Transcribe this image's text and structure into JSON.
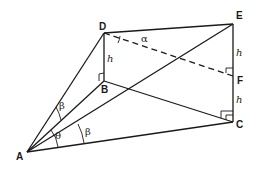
{
  "diagram": {
    "type": "geometry",
    "points": {
      "A": {
        "label": "A",
        "x": 27,
        "y": 152
      },
      "B": {
        "label": "B",
        "x": 104,
        "y": 81
      },
      "C": {
        "label": "C",
        "x": 233,
        "y": 122
      },
      "D": {
        "label": "D",
        "x": 104,
        "y": 33
      },
      "E": {
        "label": "E",
        "x": 233,
        "y": 24
      },
      "F": {
        "label": "F",
        "x": 233,
        "y": 76
      }
    },
    "segments": [
      {
        "from": "A",
        "to": "D",
        "style": "solid"
      },
      {
        "from": "A",
        "to": "B",
        "style": "solid"
      },
      {
        "from": "A",
        "to": "E",
        "style": "solid"
      },
      {
        "from": "A",
        "to": "C",
        "style": "solid"
      },
      {
        "from": "D",
        "to": "B",
        "style": "solid"
      },
      {
        "from": "D",
        "to": "E",
        "style": "solid"
      },
      {
        "from": "B",
        "to": "C",
        "style": "solid"
      },
      {
        "from": "E",
        "to": "C",
        "style": "solid"
      },
      {
        "from": "D",
        "to": "F",
        "style": "dashed"
      }
    ],
    "labels": {
      "h_DB": "h",
      "h_EF": "h",
      "h_FC": "h",
      "alpha": "α",
      "beta_upper": "β",
      "beta_lower": "β",
      "theta": "θ"
    },
    "right_angles": [
      "B",
      "F",
      "C"
    ]
  }
}
